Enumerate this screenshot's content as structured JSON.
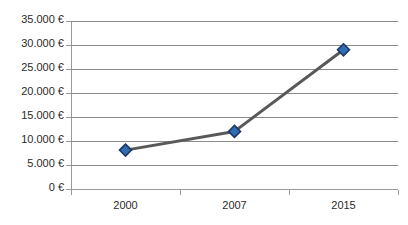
{
  "chart_data": {
    "type": "line",
    "title": "",
    "clipped_top_text": "",
    "xlabel": "",
    "ylabel": "",
    "categories": [
      "2000",
      "2007",
      "2015"
    ],
    "values": [
      8100,
      12000,
      29000
    ],
    "series": [
      {
        "name": "",
        "values": [
          8100,
          12000,
          29000
        ],
        "line_color": "#595959",
        "marker_fill": "#2e6db4",
        "marker_border": "#1f3864",
        "marker_shape": "diamond"
      }
    ],
    "ylim": [
      0,
      35000
    ],
    "ytick_values": [
      0,
      5000,
      10000,
      15000,
      20000,
      25000,
      30000,
      35000
    ],
    "ytick_labels": [
      "0 €",
      "5.000 €",
      "10.000 €",
      "15.000 €",
      "20.000 €",
      "25.000 €",
      "30.000 €",
      "35.000 €"
    ],
    "xtick_labels": [
      "2000",
      "2007",
      "2015"
    ],
    "grid": {
      "horizontal": true,
      "vertical": false,
      "color": "#8c8c8c"
    },
    "legend": {
      "visible": false,
      "position": "none",
      "entries": []
    },
    "currency_symbol": "€",
    "thousands_separator": ".",
    "background_color": "#ffffff",
    "axis_color": "#9a9a9a",
    "text_color": "#2b2b2b"
  }
}
